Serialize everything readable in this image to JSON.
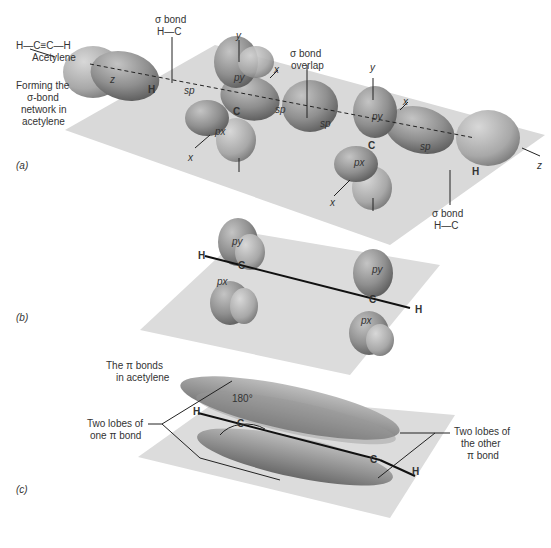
{
  "header": {
    "formula": "H—C≡C—H",
    "molecule_name": "Acetylene",
    "caption_a": [
      "Forming the",
      "σ-bond",
      "network in",
      "acetylene"
    ]
  },
  "panel_a": {
    "label": "(a)",
    "sigma_hc_left": [
      "σ bond",
      "H—C"
    ],
    "sigma_overlap": [
      "σ bond",
      "overlap"
    ],
    "sigma_hc_right": [
      "σ bond",
      "H—C"
    ],
    "axes": {
      "z_left": "z",
      "z_right": "z",
      "y1": "y",
      "y2": "y",
      "x1": "x",
      "x2": "x",
      "x3": "x",
      "x4": "x"
    },
    "orbitals": {
      "sp1": "sp",
      "sp2": "sp",
      "sp3": "sp",
      "sp4": "sp",
      "py1": "py",
      "py2": "py",
      "px1": "px",
      "px2": "px"
    },
    "atoms": {
      "h1": "H",
      "c1": "C",
      "c2": "C",
      "h2": "H"
    }
  },
  "panel_b": {
    "label": "(b)",
    "orbitals": {
      "py1": "py",
      "px1": "px",
      "py2": "py",
      "px2": "px"
    },
    "atoms": {
      "h1": "H",
      "c1": "C",
      "c2": "C",
      "h2": "H"
    }
  },
  "panel_c": {
    "label": "(c)",
    "caption": [
      "The π bonds",
      "in acetylene"
    ],
    "angle": "180°",
    "left_note": [
      "Two lobes of",
      "one π bond"
    ],
    "right_note": [
      "Two lobes of",
      "the other",
      "π bond"
    ],
    "atoms": {
      "h1": "H",
      "c1": "C",
      "c2": "C",
      "h2": "H"
    }
  },
  "colors": {
    "plane": "#d6d6d6",
    "lobe": "#8a8a8a",
    "lobe_light": "#b4b4b4",
    "text": "#333333"
  }
}
